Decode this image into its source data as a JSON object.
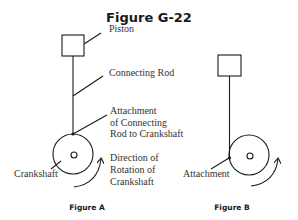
{
  "title": "Figure G-22",
  "figure_a": {
    "caption": "Figure A",
    "labels": {
      "piston": "Piston",
      "connecting_rod": "Connecting Rod",
      "attachment": [
        "Attachment",
        "of Connecting",
        "Rod to Crankshaft"
      ],
      "crankshaft": "Crankshaft",
      "direction": [
        "Direction of",
        "Rotation of",
        "Crankshaft"
      ]
    }
  },
  "figure_b": {
    "caption": "Figure B",
    "labels": {
      "attachment": "Attachment"
    }
  },
  "colors": {
    "line": "#1a1a1a",
    "label_text": "#333333",
    "background": "#ffffff"
  }
}
